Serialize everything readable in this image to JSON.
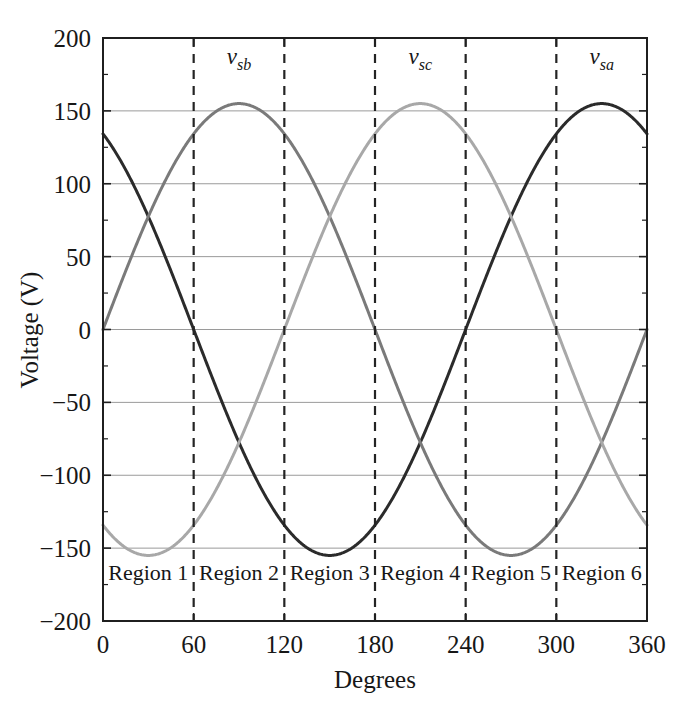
{
  "chart_data": {
    "type": "line",
    "title": "",
    "xlabel": "Degrees",
    "ylabel": "Voltage (V)",
    "xlim": [
      0,
      360
    ],
    "ylim": [
      -200,
      200
    ],
    "xticks": [
      "0",
      "60",
      "120",
      "180",
      "240",
      "300",
      "360"
    ],
    "xtick_values": [
      0,
      60,
      120,
      180,
      240,
      300,
      360
    ],
    "yticks": [
      "200",
      "150",
      "100",
      "50",
      "0",
      "−50",
      "−100",
      "−150",
      "−200"
    ],
    "ytick_values": [
      200,
      150,
      100,
      50,
      0,
      -50,
      -100,
      -150,
      -200
    ],
    "grid": "horizontal",
    "legend_position": "inline-annotations",
    "amplitude": 155,
    "series": [
      {
        "name": "v_sa",
        "label": "v",
        "label_sub": "sa",
        "color": "#2b2b2b",
        "phase_deg": 240,
        "amplitude": 155,
        "label_x_deg": 330,
        "label_y_v": 182,
        "x": [
          0,
          15,
          30,
          45,
          60,
          75,
          90,
          105,
          120,
          135,
          150,
          165,
          180,
          195,
          210,
          225,
          240,
          255,
          270,
          285,
          300,
          315,
          330,
          345,
          360
        ],
        "values": [
          134.2,
          109.6,
          77.5,
          40.1,
          0,
          -40.1,
          -77.5,
          -109.6,
          -134.2,
          -149.7,
          -155,
          -149.7,
          -134.2,
          -109.6,
          -77.5,
          -40.1,
          0,
          40.1,
          77.5,
          109.6,
          134.2,
          149.7,
          155,
          149.7,
          134.2
        ]
      },
      {
        "name": "v_sb",
        "label": "v",
        "label_sub": "sb",
        "color": "#7a7a7a",
        "phase_deg": 0,
        "amplitude": 155,
        "label_x_deg": 90,
        "label_y_v": 182,
        "x": [
          0,
          15,
          30,
          45,
          60,
          75,
          90,
          105,
          120,
          135,
          150,
          165,
          180,
          195,
          210,
          225,
          240,
          255,
          270,
          285,
          300,
          315,
          330,
          345,
          360
        ],
        "values": [
          0,
          40.1,
          77.5,
          109.6,
          134.2,
          149.7,
          155,
          149.7,
          134.2,
          109.6,
          77.5,
          40.1,
          0,
          -40.1,
          -77.5,
          -109.6,
          -134.2,
          -149.7,
          -155,
          -149.7,
          -134.2,
          -109.6,
          -77.5,
          -40.1,
          0
        ]
      },
      {
        "name": "v_sc",
        "label": "v",
        "label_sub": "sc",
        "color": "#a8a8a8",
        "phase_deg": 120,
        "amplitude": 155,
        "label_x_deg": 210,
        "label_y_v": 182,
        "x": [
          0,
          15,
          30,
          45,
          60,
          75,
          90,
          105,
          120,
          135,
          150,
          165,
          180,
          195,
          210,
          225,
          240,
          255,
          270,
          285,
          300,
          315,
          330,
          345,
          360
        ],
        "values": [
          -134.2,
          -149.7,
          -155,
          -149.7,
          -134.2,
          -109.6,
          -77.5,
          -40.1,
          0,
          40.1,
          77.5,
          109.6,
          134.2,
          149.7,
          155,
          149.7,
          134.2,
          109.6,
          77.5,
          40.1,
          0,
          -40.1,
          -77.5,
          -109.6,
          -134.2
        ]
      }
    ],
    "region_dividers_deg": [
      60,
      120,
      180,
      240,
      300
    ],
    "regions": [
      {
        "label": "Region 1",
        "start_deg": 0,
        "end_deg": 60
      },
      {
        "label": "Region 2",
        "start_deg": 60,
        "end_deg": 120
      },
      {
        "label": "Region 3",
        "start_deg": 120,
        "end_deg": 180
      },
      {
        "label": "Region 4",
        "start_deg": 180,
        "end_deg": 240
      },
      {
        "label": "Region 5",
        "start_deg": 240,
        "end_deg": 300
      },
      {
        "label": "Region 6",
        "start_deg": 300,
        "end_deg": 360
      }
    ],
    "region_label_y_v": -172,
    "colors": {
      "axis": "#1f1f1f",
      "gridline": "#9a9a9a",
      "divider": "#242424",
      "background": "#ffffff"
    }
  }
}
